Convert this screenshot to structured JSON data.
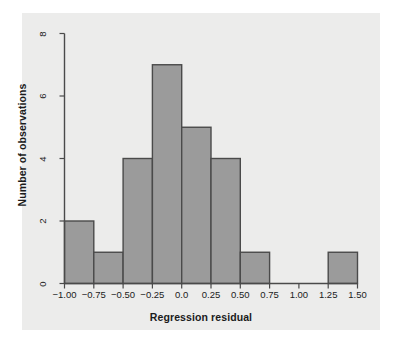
{
  "chart_data": {
    "type": "bar",
    "subtype": "histogram",
    "title": "",
    "xlabel": "Regression residual",
    "ylabel": "Number of observations",
    "xlim": [
      -1.0,
      1.5
    ],
    "ylim": [
      0,
      8
    ],
    "bin_width": 0.25,
    "grid": false,
    "legend": null,
    "bin_edges": [
      -1.0,
      -0.75,
      -0.5,
      -0.25,
      0.0,
      0.25,
      0.5,
      0.75,
      1.0,
      1.25,
      1.5
    ],
    "categories": [
      "-1.00 to -0.75",
      "-0.75 to -0.50",
      "-0.50 to -0.25",
      "-0.25 to 0.00",
      "0.00 to 0.25",
      "0.25 to 0.50",
      "0.50 to 0.75",
      "0.75 to 1.00",
      "1.00 to 1.25",
      "1.25 to 1.50"
    ],
    "values": [
      2,
      1,
      4,
      7,
      5,
      4,
      1,
      0,
      0,
      1
    ],
    "xticks": [
      -1.0,
      -0.75,
      -0.5,
      -0.25,
      0.0,
      0.25,
      0.5,
      0.75,
      1.0,
      1.25,
      1.5
    ],
    "xtick_labels": [
      "−1.00",
      "−0.75",
      "−0.50",
      "−0.25",
      "0.0",
      "0.25",
      "0.50",
      "0.75",
      "1.00",
      "1.25",
      "1.50"
    ],
    "yticks": [
      0,
      2,
      4,
      6,
      8
    ],
    "ytick_labels": [
      "0",
      "2",
      "4",
      "6",
      "8"
    ],
    "total_observations": 25,
    "colors": {
      "bar_fill": "#9b9b9b",
      "bar_stroke": "#4a4a4a",
      "axis": "#4a4a4a",
      "panel_background": "#ececeb",
      "figure_background": "#ffffff",
      "text": "#1b1b1b"
    }
  }
}
